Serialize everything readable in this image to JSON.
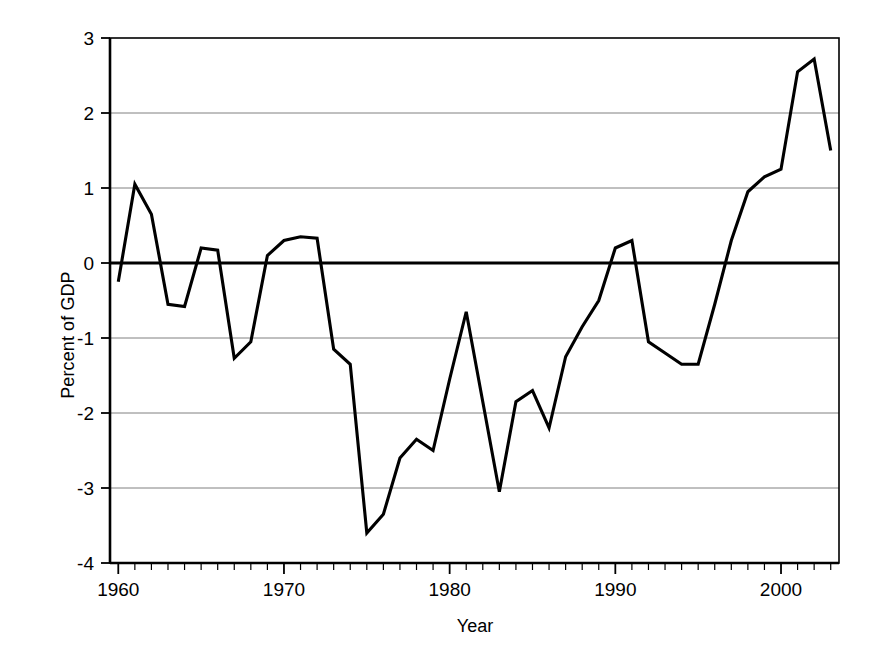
{
  "chart_data": {
    "type": "line",
    "title": "",
    "xlabel": "Year",
    "ylabel": "Percent of GDP",
    "xlim": [
      1959.5,
      2003.5
    ],
    "ylim": [
      -4,
      3
    ],
    "xticks": [
      1960,
      1970,
      1980,
      1990,
      2000
    ],
    "xticklabels": [
      "1960",
      "1970",
      "1980",
      "1990",
      "2000"
    ],
    "yticks": [
      -4,
      -3,
      -2,
      -1,
      0,
      1,
      2,
      3
    ],
    "yticklabels": [
      "-4",
      "-3",
      "-2",
      "-1",
      "0",
      "1",
      "2",
      "3"
    ],
    "grid": "horizontal",
    "minor_xtick_interval": 1,
    "legend": "none",
    "line_color": "#000000",
    "grid_color": "#808080",
    "axis_color": "#000000",
    "background": "#ffffff",
    "zero_line_emphasized": true,
    "x": [
      1960,
      1961,
      1962,
      1963,
      1964,
      1965,
      1966,
      1967,
      1968,
      1969,
      1970,
      1971,
      1972,
      1973,
      1974,
      1975,
      1976,
      1977,
      1978,
      1979,
      1980,
      1981,
      1982,
      1983,
      1984,
      1985,
      1986,
      1987,
      1988,
      1989,
      1990,
      1991,
      1992,
      1993,
      1994,
      1995,
      1996,
      1997,
      1998,
      1999,
      2000,
      2001,
      2002,
      2003
    ],
    "values": [
      -0.25,
      1.05,
      0.65,
      -0.55,
      -0.58,
      0.2,
      0.17,
      -1.27,
      -1.05,
      0.1,
      0.3,
      0.35,
      0.33,
      -1.15,
      -1.35,
      -3.6,
      -3.35,
      -2.6,
      -2.35,
      -2.5,
      -1.55,
      -0.65,
      -1.85,
      -3.05,
      -1.85,
      -1.7,
      -2.2,
      -1.25,
      -0.85,
      -0.5,
      0.2,
      0.3,
      -1.05,
      -1.2,
      -1.35,
      -1.35,
      -0.55,
      0.3,
      0.95,
      1.15,
      1.25,
      2.55,
      2.72,
      1.5
    ],
    "series": [
      {
        "name": "Percent of GDP",
        "values": [
          -0.25,
          1.05,
          0.65,
          -0.55,
          -0.58,
          0.2,
          0.17,
          -1.27,
          -1.05,
          0.1,
          0.3,
          0.35,
          0.33,
          -1.15,
          -1.35,
          -3.6,
          -3.35,
          -2.6,
          -2.35,
          -2.5,
          -1.55,
          -0.65,
          -1.85,
          -3.05,
          -1.85,
          -1.7,
          -2.2,
          -1.25,
          -0.85,
          -0.5,
          0.2,
          0.3,
          -1.05,
          -1.2,
          -1.35,
          -1.35,
          -0.55,
          0.3,
          0.95,
          1.15,
          1.25,
          2.55,
          2.72,
          1.5
        ]
      }
    ]
  }
}
